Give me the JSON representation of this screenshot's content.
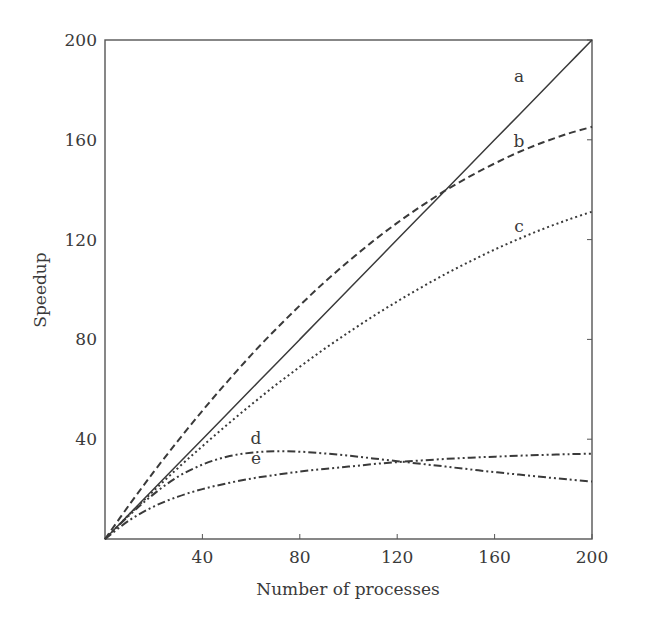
{
  "chart_data": {
    "type": "line",
    "title": "",
    "xlabel": "Number of processes",
    "ylabel": "Speedup",
    "xlim": [
      0,
      200
    ],
    "ylim": [
      0,
      200
    ],
    "xticks": [
      40,
      80,
      120,
      160,
      200
    ],
    "yticks": [
      40,
      80,
      120,
      160,
      200
    ],
    "grid": false,
    "legend": "inline curve labels",
    "x": [
      0,
      10,
      20,
      30,
      40,
      50,
      60,
      70,
      80,
      90,
      100,
      110,
      120,
      130,
      140,
      150,
      160,
      170,
      180,
      190,
      200
    ],
    "series": [
      {
        "name": "a",
        "style": "solid",
        "values": [
          0,
          10,
          20,
          30,
          40,
          50,
          60,
          70,
          80,
          90,
          100,
          110,
          120,
          130,
          140,
          150,
          160,
          170,
          180,
          190,
          200
        ]
      },
      {
        "name": "b",
        "style": "dashed",
        "values": [
          0,
          13.7,
          26.9,
          39.4,
          51.4,
          62.8,
          73.7,
          83.9,
          93.6,
          102.8,
          111.3,
          119.3,
          126.7,
          133.5,
          139.8,
          145.4,
          150.5,
          155.1,
          159.0,
          162.4,
          165.2
        ]
      },
      {
        "name": "c",
        "style": "dotted",
        "values": [
          0,
          9.8,
          19.3,
          28.5,
          37.2,
          45.7,
          53.8,
          61.6,
          69.0,
          76.1,
          82.8,
          89.2,
          95.2,
          100.9,
          106.3,
          111.3,
          116.0,
          120.3,
          124.3,
          127.9,
          131.2
        ]
      },
      {
        "name": "d",
        "style": "dash-dot-dot",
        "values": [
          0,
          9.5,
          18,
          25,
          29.8,
          33,
          34.6,
          35.2,
          35,
          34.3,
          33.4,
          32.3,
          31.2,
          30.1,
          29.0,
          27.9,
          26.8,
          25.8,
          24.8,
          23.9,
          23.0
        ]
      },
      {
        "name": "e",
        "style": "dash-dot-dot",
        "values": [
          0,
          7.5,
          13,
          17,
          20,
          22.3,
          24.2,
          25.7,
          27,
          28.1,
          29.0,
          30.0,
          30.8,
          31.5,
          32.1,
          32.6,
          33.0,
          33.4,
          33.7,
          34.0,
          34.2
        ]
      }
    ],
    "annotations": [
      {
        "text": "a",
        "x": 170,
        "y": 183
      },
      {
        "text": "b",
        "x": 170,
        "y": 157
      },
      {
        "text": "c",
        "x": 170,
        "y": 123
      },
      {
        "text": "d",
        "x": 62,
        "y": 38
      },
      {
        "text": "e",
        "x": 62,
        "y": 30
      }
    ]
  }
}
